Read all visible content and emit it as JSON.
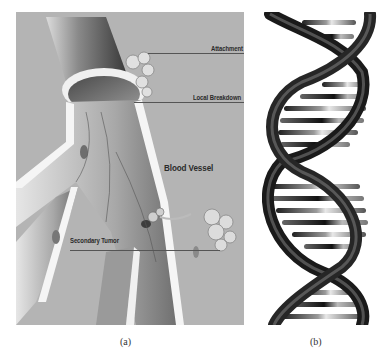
{
  "figure": {
    "panel_a": {
      "caption": "(a)",
      "labels": {
        "attachment": "Attachment",
        "local_breakdown": "Local Breakdown",
        "blood_vessel": "Blood Vessel",
        "secondary_tumor": "Secondary Tumor"
      }
    },
    "panel_b": {
      "caption": "(b)"
    }
  }
}
